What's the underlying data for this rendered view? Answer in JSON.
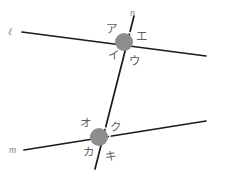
{
  "figure": {
    "colors": {
      "line": "#1a1a1a",
      "node_disc": "#8d8d8d",
      "arc": "#ffffff",
      "label": "#5e5e5e",
      "background": "#ffffff"
    },
    "lines": [
      {
        "name": "l",
        "label": "ℓ",
        "x1": 22,
        "y1": 32,
        "x2": 206,
        "y2": 56,
        "label_x": 8,
        "label_y": 27
      },
      {
        "name": "m",
        "label": "m",
        "x1": 24,
        "y1": 150,
        "x2": 206,
        "y2": 121,
        "label_x": 9,
        "label_y": 145
      },
      {
        "name": "n",
        "label": "n",
        "x1": 134,
        "y1": 16,
        "x2": 95,
        "y2": 169,
        "label_x": 130,
        "label_y": 8
      }
    ],
    "intersections": [
      {
        "name": "upper-intersection",
        "cx": 124,
        "cy": 42,
        "r": 9,
        "arc_r": 11,
        "arc_start_deg": -78,
        "arc_end_deg": 8,
        "labels": [
          {
            "name": "angle-a",
            "text": "ア",
            "x": 106,
            "y": 24,
            "position": "upper-left"
          },
          {
            "name": "angle-e",
            "text": "エ",
            "x": 136,
            "y": 31,
            "position": "upper-right"
          },
          {
            "name": "angle-i",
            "text": "イ",
            "x": 108,
            "y": 50,
            "position": "lower-left"
          },
          {
            "name": "angle-u",
            "text": "ウ",
            "x": 129,
            "y": 56,
            "position": "lower-right"
          }
        ]
      },
      {
        "name": "lower-intersection",
        "cx": 99,
        "cy": 137,
        "r": 9,
        "arc_r": 11,
        "arc_start_deg": -72,
        "arc_end_deg": 9,
        "labels": [
          {
            "name": "angle-o",
            "text": "オ",
            "x": 80,
            "y": 118,
            "position": "upper-left"
          },
          {
            "name": "angle-ku",
            "text": "ク",
            "x": 110,
            "y": 122,
            "position": "upper-right"
          },
          {
            "name": "angle-ka",
            "text": "カ",
            "x": 83,
            "y": 147,
            "position": "lower-left"
          },
          {
            "name": "angle-ki",
            "text": "キ",
            "x": 105,
            "y": 151,
            "position": "lower-right"
          }
        ]
      }
    ]
  }
}
